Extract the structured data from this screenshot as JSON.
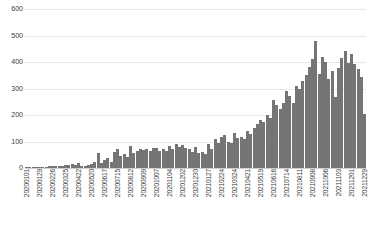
{
  "chart_data": {
    "type": "bar",
    "title": "",
    "subtitle": "",
    "xlabel": "",
    "ylabel": "",
    "ylim": [
      0,
      600
    ],
    "y_ticks": [
      0,
      100,
      200,
      300,
      400,
      500,
      600
    ],
    "grid": true,
    "legend": false,
    "legend_position": "none",
    "bar_color": "#757575",
    "gridline_color": "#e8e8e8",
    "x_tick_interval": 4,
    "categories": [
      "20200101",
      "20200108",
      "20200115",
      "20200122",
      "20200129",
      "20200205",
      "20200212",
      "20200219",
      "20200226",
      "20200304",
      "20200311",
      "20200318",
      "20200325",
      "20200401",
      "20200408",
      "20200415",
      "20200422",
      "20200429",
      "20200506",
      "20200513",
      "20200520",
      "20200527",
      "20200603",
      "20200610",
      "20200617",
      "20200624",
      "20200701",
      "20200708",
      "20200715",
      "20200722",
      "20200729",
      "20200805",
      "20200812",
      "20200819",
      "20200826",
      "20200902",
      "20200909",
      "20200916",
      "20200923",
      "20200930",
      "20201007",
      "20201014",
      "20201021",
      "20201028",
      "20201104",
      "20201111",
      "20201118",
      "20201125",
      "20201202",
      "20201209",
      "20201216",
      "20201223",
      "20201230",
      "20210106",
      "20210113",
      "20210120",
      "20210127",
      "20210203",
      "20210210",
      "20210217",
      "20210224",
      "20210303",
      "20210310",
      "20210317",
      "20210324",
      "20210331",
      "20210407",
      "20210414",
      "20210421",
      "20210428",
      "20210505",
      "20210512",
      "20210519",
      "20210526",
      "20210602",
      "20210609",
      "20210616",
      "20210623",
      "20210630",
      "20210707",
      "20210714",
      "20210721",
      "20210728",
      "20210804",
      "20210811",
      "20210818",
      "20210825",
      "20210901",
      "20210908",
      "20210915",
      "20210922",
      "20210929",
      "20211006",
      "20211013",
      "20211020",
      "20211027",
      "20211103",
      "20211110",
      "20211117",
      "20211124",
      "20211201",
      "20211208",
      "20211215",
      "20211222",
      "20211229"
    ],
    "values": [
      2,
      3,
      2,
      4,
      3,
      5,
      4,
      6,
      7,
      6,
      9,
      8,
      12,
      10,
      14,
      12,
      18,
      9,
      7,
      10,
      14,
      22,
      55,
      20,
      30,
      38,
      24,
      62,
      70,
      44,
      52,
      40,
      82,
      58,
      66,
      72,
      68,
      70,
      64,
      74,
      76,
      66,
      70,
      64,
      82,
      72,
      92,
      80,
      86,
      74,
      70,
      62,
      78,
      58,
      60,
      54,
      92,
      72,
      110,
      96,
      118,
      126,
      100,
      94,
      132,
      112,
      118,
      108,
      140,
      128,
      150,
      166,
      180,
      172,
      200,
      190,
      258,
      236,
      224,
      246,
      290,
      272,
      244,
      310,
      300,
      330,
      352,
      380,
      410,
      478,
      356,
      420,
      400,
      336,
      366,
      268,
      376,
      416,
      440,
      396,
      430,
      392,
      374,
      344,
      202
    ]
  }
}
